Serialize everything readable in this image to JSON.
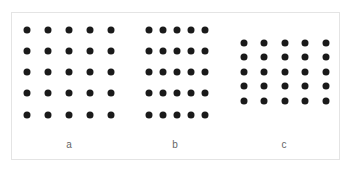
{
  "figure": {
    "dot_color": "#1a1a1a",
    "label_color": "#666666",
    "border_color": "#e4e4e4",
    "panels": [
      {
        "label": "a",
        "label_pos": [
          69,
          144
        ],
        "rows": 5,
        "cols": 5,
        "x": [
          27,
          48,
          69,
          90,
          111
        ],
        "y": [
          30,
          51,
          72,
          93,
          115
        ]
      },
      {
        "label": "b",
        "label_pos": [
          175,
          144
        ],
        "rows": 5,
        "cols": 5,
        "x": [
          149,
          163,
          177,
          191,
          205
        ],
        "y": [
          30,
          51,
          72,
          93,
          115
        ]
      },
      {
        "label": "c",
        "label_pos": [
          284,
          144
        ],
        "rows": 5,
        "cols": 5,
        "x": [
          244,
          264,
          285,
          305,
          326
        ],
        "y": [
          43,
          57,
          72,
          86,
          101
        ]
      }
    ]
  }
}
